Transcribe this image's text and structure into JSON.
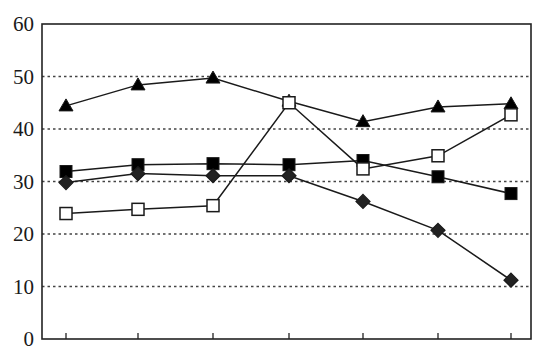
{
  "chart_data": {
    "type": "line",
    "title": "",
    "xlabel": "",
    "ylabel": "",
    "ylim": [
      0,
      60
    ],
    "yticks": [
      0,
      10,
      20,
      30,
      40,
      50,
      60
    ],
    "grid": {
      "y": true,
      "x": false,
      "style": "dotted"
    },
    "legend": null,
    "categories": [
      "",
      "",
      "",
      "",
      "",
      "",
      ""
    ],
    "x_tick_labels_note": "x-axis labels cropped at image bottom; unreadable",
    "series": [
      {
        "name": "filled-triangle",
        "marker": "triangle",
        "fill": "#000000",
        "values": [
          44.4,
          48.4,
          49.7,
          45.3,
          41.4,
          44.2,
          44.8
        ]
      },
      {
        "name": "filled-square",
        "marker": "square",
        "fill": "#000000",
        "values": [
          31.9,
          33.2,
          33.4,
          33.2,
          34.0,
          30.9,
          27.7
        ]
      },
      {
        "name": "filled-diamond",
        "marker": "diamond",
        "fill": "#222222",
        "values": [
          29.8,
          31.5,
          31.1,
          31.1,
          26.2,
          20.7,
          11.2
        ]
      },
      {
        "name": "open-square",
        "marker": "open-square",
        "fill": "#ffffff",
        "values": [
          23.9,
          24.7,
          25.4,
          45.0,
          32.4,
          34.9,
          42.7
        ]
      }
    ]
  },
  "colors": {
    "axis": "#222222",
    "grid": "#444444",
    "line": "#1a1a1a",
    "background": "#ffffff"
  }
}
